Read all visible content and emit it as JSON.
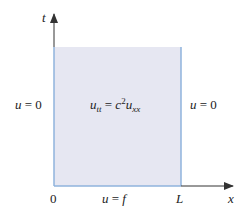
{
  "diagram": {
    "axes": {
      "vertical_label": "t",
      "horizontal_label": "x",
      "origin_label": "0",
      "length_label": "L"
    },
    "equation": {
      "u": "u",
      "tt": "tt",
      "eq": " = ",
      "c": "c",
      "exp": "2",
      "u2": "u",
      "xx": "xx"
    },
    "boundary_left": {
      "u": "u",
      "rest": " = 0"
    },
    "boundary_right": {
      "u": "u",
      "rest": " = 0"
    },
    "initial_condition": {
      "u": "u",
      "eq": " = ",
      "f": "f"
    },
    "colors": {
      "region_fill": "#e6e7f2",
      "boundary_line": "#8fb3dc",
      "axis": "#333333"
    }
  }
}
